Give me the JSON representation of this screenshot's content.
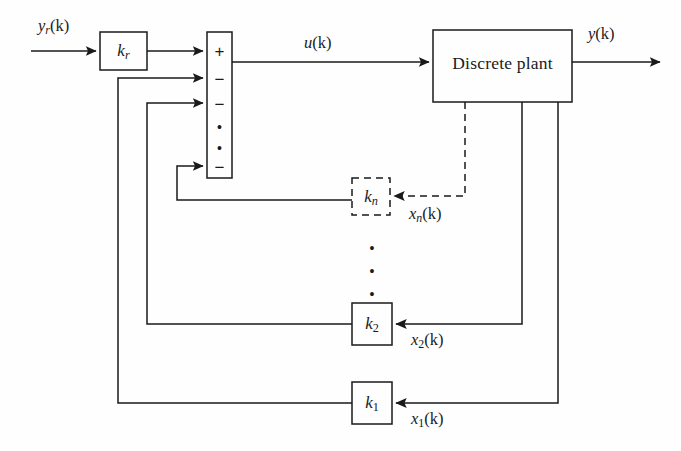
{
  "figure": {
    "kind": "control-block-diagram",
    "background_color": "#fefefe",
    "line_color": "#1a1a1a"
  },
  "blocks": {
    "reference_gain": {
      "label": "k",
      "subscript": "r",
      "name": "k_r",
      "style": "solid"
    },
    "summing_junction": {
      "name": "summing-junction",
      "style": "solid",
      "signs": [
        "+",
        "−",
        "−",
        "•",
        "•",
        "−"
      ]
    },
    "plant": {
      "label": "Discrete plant",
      "name": "discrete-plant",
      "style": "solid"
    },
    "gain_n": {
      "label": "k",
      "subscript": "n",
      "name": "k_n",
      "style": "dashed"
    },
    "gain_2": {
      "label": "k",
      "subscript": "2",
      "name": "k_2",
      "style": "solid"
    },
    "gain_1": {
      "label": "k",
      "subscript": "1",
      "name": "k_1",
      "style": "solid"
    }
  },
  "signals": {
    "reference_input": {
      "base": "y",
      "subscript": "r",
      "arg": "(k)",
      "text": "y_r(k)"
    },
    "control_input": {
      "base": "u",
      "subscript": "",
      "arg": "(k)",
      "text": "u(k)"
    },
    "plant_output": {
      "base": "y",
      "subscript": "",
      "arg": "(k)",
      "text": "y(k)"
    },
    "state_n": {
      "base": "x",
      "subscript": "n",
      "arg": "(k)",
      "text": "x_n(k)",
      "style": "dashed"
    },
    "state_2": {
      "base": "x",
      "subscript": "2",
      "arg": "(k)",
      "text": "x_2(k)",
      "style": "solid"
    },
    "state_1": {
      "base": "x",
      "subscript": "1",
      "arg": "(k)",
      "text": "x_1(k)",
      "style": "solid"
    }
  },
  "ellipses": {
    "summing_vertical_dots": "••",
    "gain_column_vertical_dots": "•••"
  }
}
